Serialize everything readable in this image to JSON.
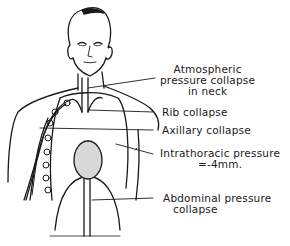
{
  "diagram": {
    "type": "anatomical-illustration",
    "labels": [
      {
        "id": "atmospheric",
        "lines": [
          "Atmospheric",
          "pressure collapse",
          "in neck"
        ]
      },
      {
        "id": "rib",
        "lines": [
          "Rib collapse"
        ]
      },
      {
        "id": "axillary",
        "lines": [
          "Axillary collapse"
        ]
      },
      {
        "id": "intrathoracic",
        "lines": [
          "Intrathoracic pressure",
          "=-4mm."
        ]
      },
      {
        "id": "abdominal",
        "lines": [
          "Abdominal pressure",
          "collapse"
        ]
      }
    ],
    "colors": {
      "ink": "#1a1a1a",
      "background": "#ffffff",
      "heart_fill": "#d8d8d8"
    }
  }
}
